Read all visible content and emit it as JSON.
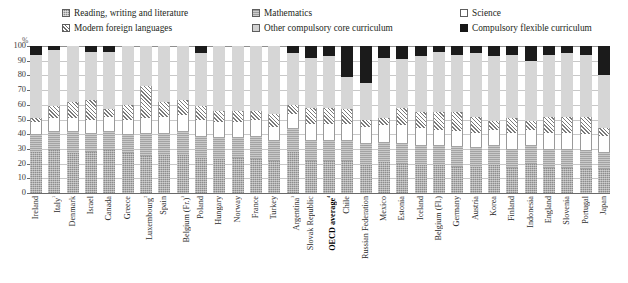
{
  "legend": {
    "items": [
      {
        "label": "Reading, writing and literature",
        "swatch": "reading-swatch",
        "key": "reading"
      },
      {
        "label": "Mathematics",
        "swatch": "mathematics-swatch",
        "key": "mathematics"
      },
      {
        "label": "Science",
        "swatch": "science-swatch",
        "key": "science"
      },
      {
        "label": "Modern foreign languages",
        "swatch": "modern-foreign-languages-swatch",
        "key": "modern_foreign_languages"
      },
      {
        "label": "Other compulsory core curriculum",
        "swatch": "other-compulsory-core-curriculum-swatch",
        "key": "other_core"
      },
      {
        "label": "Compulsory flexible curriculum",
        "swatch": "compulsory-flexible-curriculum-swatch",
        "key": "flexible"
      }
    ]
  },
  "axis": {
    "unit_label": "%",
    "yticks": [
      "100",
      "90",
      "80",
      "70",
      "60",
      "50",
      "40",
      "30",
      "20",
      "10",
      "0"
    ]
  },
  "colors": {
    "reading": "#8d8d8d",
    "mathematics": "#a4a4a4",
    "science": "#ffffff",
    "modern_foreign_languages": "#7a7a7a",
    "other_core": "#d6d6d6",
    "flexible": "#1b1b1b",
    "gridline": "#c8c8c8",
    "axis": "#6a6a6a",
    "text": "#231f20"
  },
  "chart_data": {
    "type": "bar",
    "stacked": true,
    "stack_total": 100,
    "title": "",
    "xlabel": "",
    "ylabel": "%",
    "ylim": [
      0,
      100
    ],
    "ytick_step": 10,
    "grid": true,
    "legend_position": "top",
    "series_order": [
      "Reading, writing and literature",
      "Mathematics",
      "Science",
      "Modern foreign languages",
      "Other compulsory core curriculum",
      "Compulsory flexible curriculum"
    ],
    "categories": [
      "Ireland",
      "Italy¹",
      "Denmark",
      "Israel",
      "Canada",
      "Greece",
      "Luxembourg²",
      "Spain",
      "Belgium (Fr.)³",
      "Poland",
      "Hungary",
      "Norway",
      "France",
      "Turkey",
      "Argentina³",
      "Slovak Republic",
      "OECD average⁴",
      "Chile",
      "Russian Federation",
      "Mexico",
      "Estonia",
      "Iceland",
      "Belgium (Fl.)",
      "Germany",
      "Austria",
      "Korea",
      "Finland",
      "Indonesia",
      "England",
      "Slovenia",
      "Portugal",
      "Japan"
    ],
    "categories_plain": [
      "Ireland",
      "Italy",
      "Denmark",
      "Israel",
      "Canada",
      "Greece",
      "Luxembourg",
      "Spain",
      "Belgium (Fr.)",
      "Poland",
      "Hungary",
      "Norway",
      "France",
      "Turkey",
      "Argentina",
      "Slovak Republic",
      "OECD average",
      "Chile",
      "Russian Federation",
      "Mexico",
      "Estonia",
      "Iceland",
      "Belgium (Fl.)",
      "Germany",
      "Austria",
      "Korea",
      "Finland",
      "Indonesia",
      "England",
      "Slovenia",
      "Portugal",
      "Japan"
    ],
    "bold_categories": [
      "OECD average⁴"
    ],
    "series": [
      {
        "name": "Reading, writing and literature",
        "values": [
          28,
          29,
          27,
          28,
          29,
          27,
          25,
          26,
          26,
          24,
          23,
          24,
          23,
          22,
          28,
          22,
          22,
          22,
          19,
          21,
          20,
          19,
          19,
          18,
          18,
          19,
          17,
          20,
          17,
          17,
          16,
          16
        ]
      },
      {
        "name": "Mathematics",
        "values": [
          12,
          13,
          15,
          13,
          13,
          13,
          16,
          15,
          16,
          15,
          15,
          14,
          16,
          14,
          16,
          14,
          14,
          14,
          15,
          14,
          14,
          14,
          14,
          14,
          13,
          14,
          13,
          13,
          13,
          13,
          13,
          12
        ]
      },
      {
        "name": "Science",
        "values": [
          8,
          9,
          9,
          9,
          10,
          10,
          10,
          11,
          11,
          11,
          10,
          10,
          11,
          9,
          10,
          11,
          11,
          11,
          11,
          11,
          12,
          11,
          10,
          10,
          10,
          10,
          11,
          10,
          11,
          11,
          11,
          11
        ]
      },
      {
        "name": "Modern foreign languages",
        "values": [
          3,
          8,
          11,
          13,
          5,
          10,
          22,
          10,
          10,
          9,
          8,
          8,
          6,
          9,
          6,
          11,
          11,
          10,
          5,
          5,
          12,
          11,
          12,
          13,
          11,
          6,
          10,
          6,
          11,
          11,
          12,
          5
        ]
      },
      {
        "name": "Other compulsory core curriculum",
        "values": [
          43,
          38,
          38,
          33,
          39,
          40,
          27,
          38,
          37,
          36,
          44,
          44,
          44,
          46,
          35,
          34,
          35,
          22,
          25,
          41,
          33,
          38,
          41,
          39,
          43,
          44,
          43,
          41,
          42,
          43,
          42,
          36
        ]
      },
      {
        "name": "Compulsory flexible curriculum",
        "values": [
          6,
          3,
          0,
          4,
          4,
          0,
          0,
          0,
          0,
          5,
          0,
          0,
          0,
          0,
          5,
          8,
          7,
          21,
          25,
          8,
          9,
          7,
          4,
          6,
          5,
          7,
          6,
          10,
          6,
          5,
          6,
          20
        ]
      }
    ]
  }
}
